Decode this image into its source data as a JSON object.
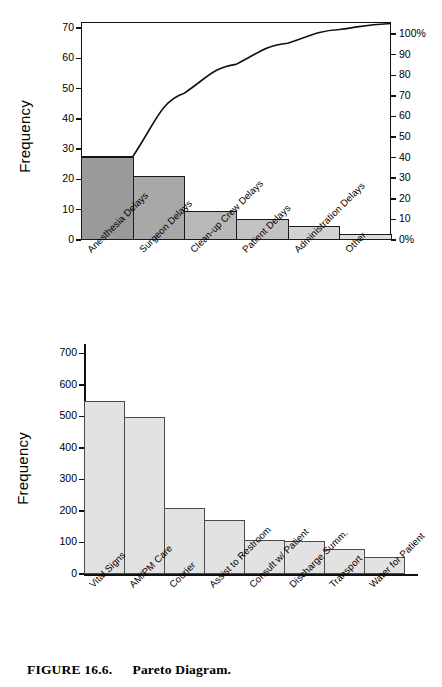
{
  "caption": {
    "figure_number": "FIGURE 16.6.",
    "title": "Pareto Diagram."
  },
  "chart_data": [
    {
      "id": "pareto-or-delays",
      "type": "bar",
      "title": "",
      "xlabel": "",
      "ylabel": "Frequency",
      "categories": [
        "Anesthesia Delays",
        "Surgeon Delays",
        "Clean-up Crew Delays",
        "Patient Delays",
        "Administration Delays",
        "Other"
      ],
      "values": [
        27.5,
        21,
        9.5,
        7,
        4.5,
        2
      ],
      "cumulative_values": [
        27.5,
        48.5,
        58,
        65,
        69.5,
        71.5
      ],
      "cumulative_percent": [
        38,
        68,
        81,
        91,
        97,
        100
      ],
      "ylim": [
        0,
        72
      ],
      "yticks": [
        0,
        10,
        20,
        30,
        40,
        50,
        60,
        70
      ],
      "ytick_labels": [
        "0",
        "10",
        "20",
        "30",
        "40",
        "50",
        "60",
        "70"
      ],
      "secondary_axis": {
        "ylim": [
          0,
          100
        ],
        "ticks": [
          0,
          10,
          20,
          30,
          40,
          50,
          60,
          70,
          80,
          90,
          100
        ],
        "tick_labels": [
          "0%",
          "10",
          "20",
          "30",
          "40",
          "50",
          "60",
          "70",
          "80",
          "90",
          "100%"
        ]
      },
      "grid": false,
      "legend": "none",
      "bar_shades": [
        "#9a9a9a",
        "#a8a8a8",
        "#b8b8b8",
        "#c2c2c2",
        "#d2d2d2",
        "#dcdcdc"
      ],
      "line_color": "#111111"
    },
    {
      "id": "pareto-nursing-requests",
      "type": "bar",
      "title": "",
      "xlabel": "",
      "ylabel": "Frequency",
      "categories": [
        "Vital Signs",
        "AM/PM Care",
        "Courier",
        "Assist to Restroom",
        "Consult w/ Patient",
        "Discharge Summ.",
        "Transport",
        "Water for Patient"
      ],
      "values": [
        550,
        498,
        210,
        170,
        108,
        105,
        78,
        55
      ],
      "ylim": [
        0,
        730
      ],
      "yticks": [
        0,
        100,
        200,
        300,
        400,
        500,
        600,
        700
      ],
      "ytick_labels": [
        "0",
        "100",
        "200",
        "300",
        "400",
        "500",
        "600",
        "700"
      ],
      "grid": false,
      "legend": "none",
      "bar_fill": "#e2e2e2",
      "bar_stroke": "#4a4a4a"
    }
  ]
}
